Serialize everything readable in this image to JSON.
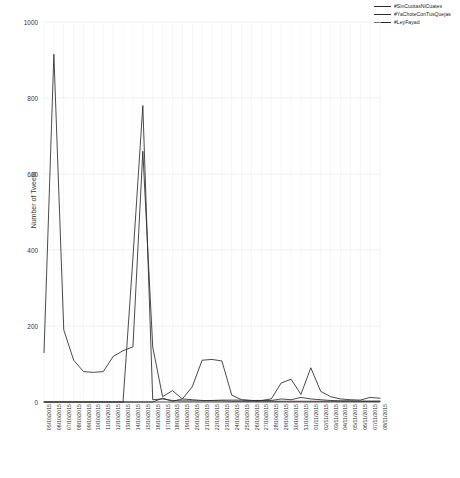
{
  "chart_data": {
    "type": "line",
    "title": "",
    "xlabel": "",
    "ylabel": "Number of Tweets",
    "ylim": [
      0,
      1000
    ],
    "yticks": [
      0,
      200,
      400,
      600,
      800,
      1000
    ],
    "grid": true,
    "legend_position": "top-right",
    "categories": [
      "05/10/2015",
      "06/10/2015",
      "07/10/2015",
      "08/10/2015",
      "09/10/2015",
      "10/10/2015",
      "11/10/2015",
      "12/10/2015",
      "13/10/2015",
      "14/10/2015",
      "15/10/2015",
      "16/10/2015",
      "17/10/2015",
      "18/10/2015",
      "19/10/2015",
      "20/10/2015",
      "21/10/2015",
      "22/10/2015",
      "23/10/2015",
      "24/10/2015",
      "25/10/2015",
      "26/10/2015",
      "27/10/2015",
      "28/10/2015",
      "29/10/2015",
      "30/10/2015",
      "31/10/2015",
      "01/11/2015",
      "02/11/2015",
      "03/11/2015",
      "04/11/2015",
      "05/11/2015",
      "06/11/2015",
      "07/11/2015",
      "08/11/2015"
    ],
    "series": [
      {
        "name": "#SinCuotasNiCuates",
        "color": "#2b2b2b",
        "values": [
          130,
          915,
          190,
          110,
          80,
          78,
          80,
          120,
          135,
          145,
          660,
          145,
          14,
          30,
          8,
          6,
          4,
          3,
          3,
          2,
          2,
          2,
          2,
          2,
          2,
          2,
          2,
          2,
          2,
          2,
          2,
          2,
          2,
          2,
          2
        ]
      },
      {
        "name": "#YaChoteConTusQuejas",
        "color": "#2b2b2b",
        "values": [
          0,
          0,
          0,
          0,
          0,
          0,
          0,
          0,
          0,
          0,
          0,
          0,
          10,
          2,
          8,
          40,
          110,
          112,
          108,
          18,
          6,
          4,
          4,
          4,
          8,
          6,
          12,
          8,
          6,
          4,
          3,
          3,
          2,
          2,
          2
        ]
      },
      {
        "name": "#LeyFayad",
        "color": "#2b2b2b",
        "values": [
          0,
          0,
          0,
          0,
          0,
          0,
          0,
          0,
          0,
          380,
          780,
          6,
          8,
          4,
          3,
          3,
          3,
          4,
          5,
          5,
          5,
          4,
          4,
          8,
          50,
          60,
          20,
          90,
          28,
          14,
          8,
          6,
          5,
          12,
          10
        ]
      }
    ]
  }
}
